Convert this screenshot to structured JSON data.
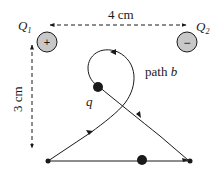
{
  "charges": {
    "q1": {
      "label": "Q",
      "sub": "1",
      "sign": "+"
    },
    "q2": {
      "label": "Q",
      "sub": "2",
      "sign": "−"
    }
  },
  "dimensions": {
    "horizontal": "4 cm",
    "vertical": "3 cm"
  },
  "points": {
    "a": "A",
    "b": "B"
  },
  "paths": {
    "a": {
      "word": "path",
      "letter": "a"
    },
    "b": {
      "word": "path",
      "letter": "b"
    }
  },
  "test_charge": "q",
  "colors": {
    "charge_fill": "#c8c8c8",
    "stroke": "#1a1a1a"
  }
}
